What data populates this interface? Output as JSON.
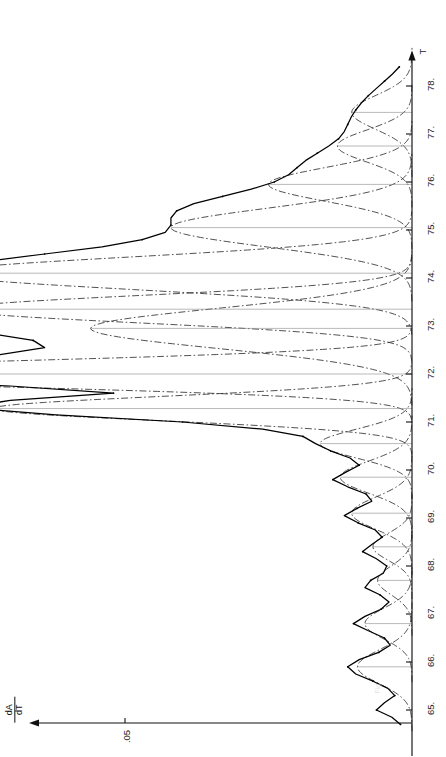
{
  "figure": {
    "name": "derivative-melting-curve",
    "orientation": "rotated-90-ccw",
    "caption_fragment": "Fig. 2."
  },
  "axes": {
    "x_axis_title": "T",
    "y_axis_numerator": "dA",
    "y_axis_denominator": "dT",
    "y_tick_label": ".05",
    "x_tick_labels": [
      "65.",
      "66.",
      "67.",
      "68.",
      "69.",
      "70.",
      "71.",
      "72.",
      "73.",
      "74.",
      "75.",
      "76.",
      "77.",
      "78."
    ]
  },
  "chart_data": {
    "type": "line",
    "title": "",
    "subtitle": "",
    "xlabel": "T",
    "ylabel": "dA/dT",
    "xlim": [
      64.6,
      78.6
    ],
    "ylim": [
      0,
      0.145
    ],
    "grid": false,
    "legend_position": "none",
    "y_ticks": [
      0.05
    ],
    "y_tick_labels": [
      ".05"
    ],
    "x_ticks": [
      65,
      66,
      67,
      68,
      69,
      70,
      71,
      72,
      73,
      74,
      75,
      76,
      77,
      78
    ],
    "x_tick_labels": [
      "65.",
      "66.",
      "67.",
      "68.",
      "69.",
      "70.",
      "71.",
      "72.",
      "73.",
      "74.",
      "75.",
      "76.",
      "77.",
      "78."
    ],
    "series": [
      {
        "name": "experimental dA/dT",
        "style": "solid-with-data-points",
        "x": [
          64.7,
          64.85,
          65.0,
          65.15,
          65.3,
          65.45,
          65.6,
          65.75,
          65.9,
          66.05,
          66.2,
          66.35,
          66.5,
          66.65,
          66.8,
          66.95,
          67.1,
          67.25,
          67.4,
          67.55,
          67.7,
          67.85,
          68.0,
          68.15,
          68.3,
          68.45,
          68.6,
          68.75,
          68.9,
          69.05,
          69.2,
          69.35,
          69.5,
          69.65,
          69.8,
          69.95,
          70.1,
          70.25,
          70.4,
          70.55,
          70.7,
          70.85,
          71.0,
          71.15,
          71.3,
          71.45,
          71.6,
          71.75,
          71.9,
          72.0,
          72.1,
          72.25,
          72.4,
          72.55,
          72.7,
          72.85,
          73.0,
          73.15,
          73.3,
          73.45,
          73.6,
          73.75,
          73.9,
          74.05,
          74.2,
          74.35,
          74.5,
          74.65,
          74.8,
          74.95,
          75.1,
          75.25,
          75.4,
          75.55,
          75.7,
          75.85,
          76.0,
          76.15,
          76.3,
          76.45,
          76.6,
          76.75,
          76.9,
          77.05,
          77.2,
          77.35,
          77.5,
          77.65,
          77.8,
          77.95,
          78.1,
          78.25,
          78.4
        ],
        "y": [
          0.002,
          0.0035,
          0.0062,
          0.0048,
          0.003,
          0.0042,
          0.0068,
          0.0098,
          0.0112,
          0.0092,
          0.0058,
          0.0038,
          0.0048,
          0.0076,
          0.0102,
          0.0082,
          0.0054,
          0.004,
          0.0056,
          0.0082,
          0.0072,
          0.005,
          0.0044,
          0.0062,
          0.0086,
          0.007,
          0.0052,
          0.0064,
          0.0094,
          0.0118,
          0.0096,
          0.007,
          0.008,
          0.0112,
          0.0138,
          0.0116,
          0.0092,
          0.0108,
          0.0142,
          0.0168,
          0.019,
          0.026,
          0.04,
          0.062,
          0.078,
          0.07,
          0.052,
          0.07,
          0.112,
          0.133,
          0.124,
          0.096,
          0.072,
          0.064,
          0.066,
          0.074,
          0.084,
          0.09,
          0.087,
          0.08,
          0.078,
          0.081,
          0.085,
          0.086,
          0.082,
          0.074,
          0.064,
          0.054,
          0.047,
          0.043,
          0.042,
          0.042,
          0.041,
          0.038,
          0.033,
          0.028,
          0.024,
          0.0215,
          0.02,
          0.0185,
          0.0165,
          0.0145,
          0.0128,
          0.0118,
          0.0112,
          0.0106,
          0.0098,
          0.0088,
          0.0076,
          0.0062,
          0.0048,
          0.0034,
          0.0022
        ]
      },
      {
        "name": "gaussian component 1",
        "style": "dash-dot",
        "center": 65.9,
        "height": 0.0095,
        "width": 0.42
      },
      {
        "name": "gaussian component 2",
        "style": "dash-dot",
        "center": 66.8,
        "height": 0.0082,
        "width": 0.38
      },
      {
        "name": "gaussian component 3",
        "style": "dash-dot",
        "center": 67.7,
        "height": 0.006,
        "width": 0.36
      },
      {
        "name": "gaussian component 4",
        "style": "dash-dot",
        "center": 68.4,
        "height": 0.0068,
        "width": 0.34
      },
      {
        "name": "gaussian component 5",
        "style": "dash-dot",
        "center": 69.1,
        "height": 0.0105,
        "width": 0.4
      },
      {
        "name": "gaussian component 6",
        "style": "dash-dot",
        "center": 69.85,
        "height": 0.0125,
        "width": 0.4
      },
      {
        "name": "gaussian component 7",
        "style": "dash-dot",
        "center": 70.55,
        "height": 0.016,
        "width": 0.36
      },
      {
        "name": "gaussian component 8",
        "style": "dash-dot",
        "center": 71.28,
        "height": 0.073,
        "width": 0.3
      },
      {
        "name": "gaussian component 9",
        "style": "dash-dot",
        "center": 72.0,
        "height": 0.127,
        "width": 0.3
      },
      {
        "name": "gaussian component 10",
        "style": "dash-dot",
        "center": 72.95,
        "height": 0.056,
        "width": 0.5
      },
      {
        "name": "gaussian component 11",
        "style": "dash-dot",
        "center": 73.35,
        "height": 0.079,
        "width": 0.34
      },
      {
        "name": "gaussian component 12",
        "style": "dash-dot",
        "center": 74.1,
        "height": 0.082,
        "width": 0.4
      },
      {
        "name": "gaussian component 13",
        "style": "dash-dot",
        "center": 75.05,
        "height": 0.042,
        "width": 0.48
      },
      {
        "name": "gaussian component 14",
        "style": "dash-dot",
        "center": 75.95,
        "height": 0.025,
        "width": 0.42
      },
      {
        "name": "gaussian component 15",
        "style": "dash-dot",
        "center": 76.75,
        "height": 0.013,
        "width": 0.4
      },
      {
        "name": "gaussian component 16",
        "style": "dash-dot",
        "center": 77.45,
        "height": 0.0105,
        "width": 0.42
      }
    ],
    "annotations": []
  },
  "colors": {
    "axis": "#111111",
    "experimental_curve": "#000000",
    "component_curve": "#333333",
    "tick_text": "#1a1a1a",
    "background": "#ffffff"
  }
}
